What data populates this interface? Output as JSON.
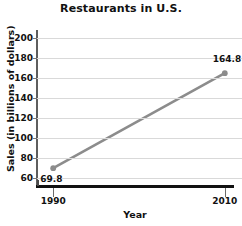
{
  "chart_data": {
    "type": "line",
    "title": "Restaurants in U.S.",
    "xlabel": "Year",
    "ylabel": "Sales (in billions of dollars)",
    "x": [
      1990,
      2010
    ],
    "values": [
      69.8,
      164.8
    ],
    "categories": [
      "1990",
      "2010"
    ],
    "point_labels": [
      "69.8",
      "164.8"
    ],
    "xtick_labels": [
      "1990",
      "2010"
    ],
    "ytick_labels": [
      "200",
      "180",
      "160",
      "140",
      "120",
      "100",
      "80",
      "60"
    ],
    "ytick_values": [
      200,
      180,
      160,
      140,
      120,
      100,
      80,
      60
    ],
    "ylim": [
      52,
      208
    ],
    "xlim": [
      1988,
      2012
    ],
    "grid": "horizontal",
    "legend": "none",
    "series_color": "#8c8c8c",
    "marker_color": "#8c8c8c",
    "gridline_color": "#d9d9d9",
    "axis_color": "#111111",
    "background_color": "#ffffff"
  }
}
